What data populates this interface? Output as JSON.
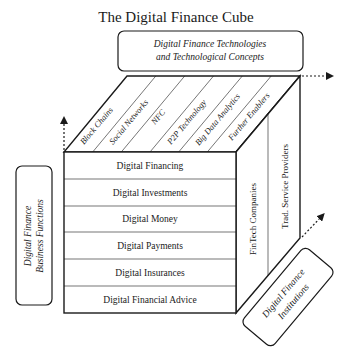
{
  "title": "The Digital Finance Cube",
  "top_box": {
    "line1": "Digital Finance Technologies",
    "line2": "and Technological Concepts"
  },
  "left_box": {
    "line1": "Digital Finance",
    "line2": "Business Functions"
  },
  "right_box": {
    "line1": "Digital Finance",
    "line2": "Institutions"
  },
  "top_face": {
    "items": [
      {
        "label": "Block Chains"
      },
      {
        "label": "Social Networks"
      },
      {
        "label": "NFC"
      },
      {
        "label": "P2P Technology"
      },
      {
        "label": "Big Data Analytics"
      },
      {
        "label": "Further Enablers"
      }
    ]
  },
  "front_face": {
    "rows": [
      {
        "label": "Digital Financing"
      },
      {
        "label": "Digital Investments"
      },
      {
        "label": "Digital Money"
      },
      {
        "label": "Digital Payments"
      },
      {
        "label": "Digital Insurances"
      },
      {
        "label": "Digital Financial Advice"
      }
    ]
  },
  "side_face": {
    "columns": [
      {
        "label": "FinTech Companies"
      },
      {
        "label": "Trad. Service Providers"
      }
    ]
  },
  "colors": {
    "line": "#1a1a1a",
    "background": "#ffffff"
  }
}
